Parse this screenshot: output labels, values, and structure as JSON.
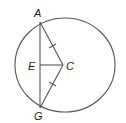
{
  "diagram": {
    "type": "geometry-circle",
    "points": {
      "A": "A",
      "E": "E",
      "C": "C",
      "G": "G"
    },
    "segments": [
      "AG",
      "AC",
      "CG",
      "EC"
    ],
    "congruent_marks": [
      "AC",
      "CG"
    ],
    "colors": {
      "line": "#555555",
      "label": "#222222",
      "background": "#ffffff"
    }
  }
}
